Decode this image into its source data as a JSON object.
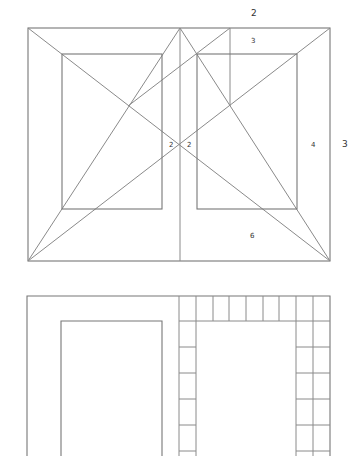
{
  "figure": {
    "top_diagram": {
      "name": "Van de Graaf canon two-page spread",
      "labels": [
        {
          "id": "top-margin-2",
          "text": "2",
          "x": 251,
          "y": 9,
          "size": "big"
        },
        {
          "id": "top-margin-3",
          "text": "3",
          "x": 251,
          "y": 38,
          "size": "small"
        },
        {
          "id": "inner-margin-left-2",
          "text": "2",
          "x": 169,
          "y": 142,
          "size": "small"
        },
        {
          "id": "inner-margin-right-2",
          "text": "2",
          "x": 187,
          "y": 142,
          "size": "small"
        },
        {
          "id": "outer-margin-4",
          "text": "4",
          "x": 311,
          "y": 142,
          "size": "small"
        },
        {
          "id": "outer-margin-3",
          "text": "3",
          "x": 342,
          "y": 140,
          "size": "big"
        },
        {
          "id": "bottom-margin-6",
          "text": "6",
          "x": 250,
          "y": 233,
          "size": "small"
        }
      ]
    },
    "bottom_diagram": {
      "name": "Ninths grid construction on two-page spread",
      "grid_columns": 9,
      "grid_rows_visible": 6
    },
    "colors": {
      "line": "#8a8a8a",
      "rect": "#777777",
      "background": "#ffffff",
      "text": "#333333"
    }
  }
}
